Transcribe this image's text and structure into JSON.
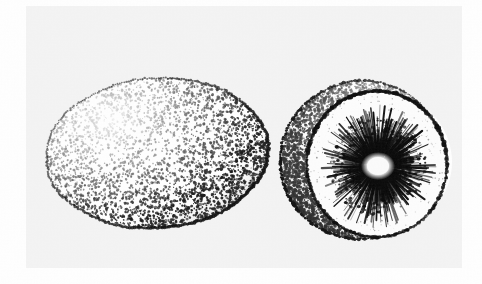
{
  "figure": {
    "medium": "stipple engraving / scanned line drawing",
    "color_mode": "black-and-white halftone",
    "canvas": {
      "width": 482,
      "height": 284
    },
    "background": {
      "page_color": "#ffffff",
      "scan_area_color": "#f4f4f4",
      "scan_area": {
        "x": 26,
        "y": 6,
        "width": 436,
        "height": 262
      },
      "ink_color": "#101010",
      "paper_texture": true
    }
  },
  "subjects": [
    {
      "id": "whole-fruit",
      "name": "whole kiwifruit",
      "view": "exterior, three-quarter side view",
      "shape": "ellipse",
      "center": {
        "x": 157,
        "y": 153
      },
      "radius": {
        "x": 111,
        "y": 75
      },
      "rotation_deg": -4,
      "outline": {
        "color": "#0d0d0d",
        "style": "irregular stippled contour",
        "thickness": 2.0
      },
      "surface_texture": {
        "type": "dense stipple",
        "description": "fuzzy hairy russet skin rendered as fine dots",
        "dot_count": 5200,
        "dot_min_radius": 0.45,
        "dot_max_radius": 1.5,
        "coverage": 0.62
      },
      "shading": {
        "light_source": "upper-left",
        "highlight": {
          "x": 112,
          "y": 112,
          "rx": 72,
          "ry": 42,
          "strength": 0.55
        },
        "shadow": {
          "x": 212,
          "y": 196,
          "rx": 70,
          "ry": 44,
          "strength": 0.92
        },
        "bottom_shadow_arc": true
      }
    },
    {
      "id": "sectioned-fruit",
      "name": "kiwifruit transverse section",
      "view": "cut face with skin crescent behind",
      "center": {
        "x": 366,
        "y": 161
      },
      "skin_crescent": {
        "name": "outer skin shell behind cut face",
        "outer": {
          "cx": 362,
          "cy": 160,
          "rx": 82,
          "ry": 79,
          "rotation_deg": -12
        },
        "inner": {
          "cx": 384,
          "cy": 162,
          "rx": 68,
          "ry": 68
        },
        "texture": {
          "type": "stipple",
          "dot_count": 2100,
          "coverage": 0.55
        },
        "rim_color": "#111111"
      },
      "cut_face": {
        "name": "flesh cut surface",
        "cx": 377,
        "cy": 164,
        "rx": 70,
        "ry": 73,
        "fill": "#fdfdfd",
        "rim_color": "#0c0c0c",
        "rim_thickness": 3.2
      },
      "core": {
        "name": "pale central columella",
        "cx": 378,
        "cy": 166,
        "rx": 14,
        "ry": 11,
        "fill": "#fbfbfb"
      },
      "radial_pattern": {
        "name": "radiating seed rays and locules",
        "description": "dark tapering lines radiating outward from pale core",
        "ray_count": 210,
        "inner_radius": 11,
        "outer_radius_x": 52,
        "outer_radius_y": 55,
        "line_color": "#0a0a0a",
        "line_width_min": 0.5,
        "line_width_max": 2.3
      },
      "seed_ring": {
        "name": "seed speckle ring",
        "dot_count": 420,
        "radius_min": 16,
        "radius_max": 48,
        "dot_color": "#080808"
      }
    }
  ],
  "annotations": {
    "labels": [],
    "caption": "",
    "scale_bar": null,
    "text_present": false
  },
  "palette": {
    "ink": "#101010",
    "paper": "#ffffff",
    "scan_tint": "#f3f3f3",
    "mid_gray": "#8a8a8a",
    "light_gray": "#d8d8d8"
  }
}
